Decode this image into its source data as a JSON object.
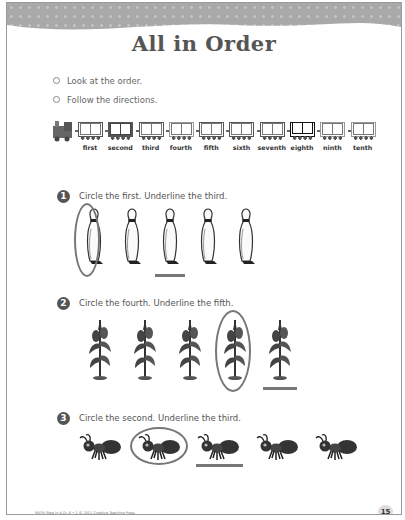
{
  "title": "All in Order",
  "instructions": [
    "Look at the order.",
    "Follow the directions."
  ],
  "train": {
    "ordinals": [
      "first",
      "second",
      "third",
      "fourth",
      "fifth",
      "sixth",
      "seventh",
      "eighth",
      "ninth",
      "tenth"
    ],
    "car_styles": [
      "medium",
      "dark",
      "medium",
      "light",
      "medium",
      "medium",
      "medium",
      "black",
      "light",
      "light"
    ]
  },
  "questions": [
    {
      "number": "1",
      "prompt": "Circle the first. Underline the third.",
      "item": "bowling-pin",
      "count": 5,
      "circled": 1,
      "underlined": 3
    },
    {
      "number": "2",
      "prompt": "Circle the fourth. Underline the fifth.",
      "item": "corn-stalk",
      "count": 5,
      "circled": 4,
      "underlined": 5
    },
    {
      "number": "3",
      "prompt": "Circle the second. Underline the third.",
      "item": "ant",
      "count": 5,
      "circled": 2,
      "underlined": 3
    }
  ],
  "footer": {
    "credit": "MATH Step In 4 Gr. K • 1 © 2011 Creative Teaching Press",
    "page_number": "15"
  },
  "colors": {
    "header_band": "#a9a9a9",
    "ink": "#555555",
    "mark": "#777777"
  }
}
